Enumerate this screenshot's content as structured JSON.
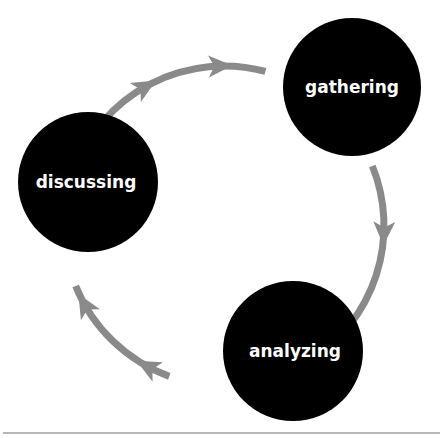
{
  "diagram": {
    "type": "cycle",
    "colors": {
      "node_fill": "#000000",
      "label": "#ffffff",
      "arrow": "#8a8a8a",
      "divider": "#b8b8b8"
    },
    "nodes": [
      {
        "id": "gathering",
        "label": "gathering"
      },
      {
        "id": "analyzing",
        "label": "analyzing"
      },
      {
        "id": "discussing",
        "label": "discussing"
      }
    ],
    "edges": [
      {
        "from": "gathering",
        "to": "analyzing",
        "direction": "clockwise"
      },
      {
        "from": "analyzing",
        "to": "discussing",
        "direction": "clockwise"
      },
      {
        "from": "discussing",
        "to": "gathering",
        "direction": "clockwise"
      }
    ]
  }
}
